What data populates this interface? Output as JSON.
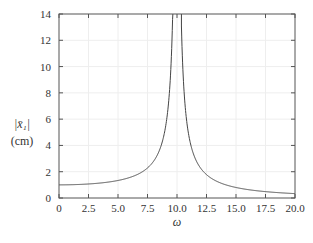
{
  "chart_data": {
    "type": "line",
    "title": "",
    "xlabel": "ω",
    "ylabel": "|x̄₁| (cm)",
    "ylabel_line1": "|x̄₁|",
    "ylabel_line2": "(cm)",
    "xlim": [
      0,
      20
    ],
    "ylim": [
      0,
      14
    ],
    "xticks": [
      "0",
      "2.5",
      "5.0",
      "7.5",
      "10.0",
      "12.5",
      "15.0",
      "17.5",
      "20.0"
    ],
    "yticks": [
      "0",
      "2",
      "4",
      "6",
      "8",
      "10",
      "12",
      "14"
    ],
    "grid": true,
    "legend": null,
    "series": [
      {
        "name": "|x̄₁|",
        "x": [
          0,
          2.5,
          5.0,
          7.5,
          8.5,
          9.0,
          9.3,
          9.6,
          10.0,
          10.4,
          10.7,
          11.0,
          12.0,
          12.5,
          15.0,
          17.5,
          20.0
        ],
        "values": [
          1.0,
          1.07,
          1.33,
          2.29,
          3.6,
          5.26,
          7.4,
          12.8,
          null,
          12.3,
          6.9,
          4.76,
          2.27,
          1.78,
          0.8,
          0.48,
          0.33
        ]
      }
    ]
  }
}
